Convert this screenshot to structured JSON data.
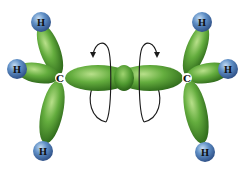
{
  "diagram": {
    "carbon_label": "C",
    "hydrogen_label": "H",
    "colors": {
      "orbital_green": "#5ea83a",
      "orbital_dark": "#2f6b1e",
      "orbital_light": "#a8d67a",
      "hydrogen_blue": "#4f7fb8",
      "hydrogen_light": "#a9c6e6",
      "arrow": "#1a1a1a",
      "background": "#ffffff"
    },
    "atoms": [
      {
        "id": "c-left",
        "label": "C",
        "x": 60,
        "y": 78
      },
      {
        "id": "c-right",
        "label": "C",
        "x": 187,
        "y": 78
      },
      {
        "id": "h-left-top",
        "label": "H",
        "x": 41,
        "y": 22
      },
      {
        "id": "h-left-side",
        "label": "H",
        "x": 17,
        "y": 69
      },
      {
        "id": "h-left-bottom",
        "label": "H",
        "x": 43,
        "y": 151
      },
      {
        "id": "h-right-top",
        "label": "H",
        "x": 202,
        "y": 22
      },
      {
        "id": "h-right-side",
        "label": "H",
        "x": 228,
        "y": 69
      },
      {
        "id": "h-right-bottom",
        "label": "H",
        "x": 205,
        "y": 152
      }
    ],
    "rotation_arrows": 2
  }
}
